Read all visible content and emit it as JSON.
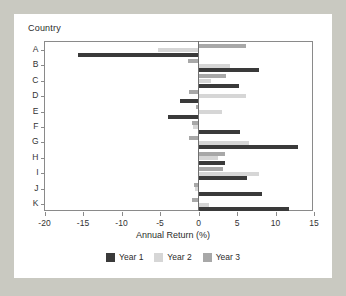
{
  "chart_data": {
    "type": "bar",
    "orientation": "horizontal",
    "title": "",
    "group_label": "Country",
    "xlabel": "Annual Return (%)",
    "ylabel": "Country",
    "categories": [
      "A",
      "B",
      "C",
      "D",
      "E",
      "F",
      "G",
      "H",
      "I",
      "J",
      "K"
    ],
    "xlim": [
      -20,
      15
    ],
    "xticks": [
      -20,
      -15,
      -10,
      -5,
      0,
      5,
      10,
      15
    ],
    "xticklabels": [
      "-20",
      "-15",
      "-10",
      "-5",
      "0",
      "5",
      "10",
      "15"
    ],
    "grid": false,
    "legend_position": "bottom",
    "series": [
      {
        "name": "Year 1",
        "color": "#3a3a3a",
        "values": [
          -15.7,
          7.9,
          5.3,
          -2.4,
          -4.0,
          5.4,
          12.9,
          3.5,
          6.3,
          8.2,
          11.7
        ]
      },
      {
        "name": "Year 2",
        "color": "#d6d6d6",
        "values": [
          -5.3,
          4.1,
          1.6,
          6.2,
          3.0,
          -0.7,
          6.6,
          2.5,
          7.8,
          -0.5,
          1.3
        ]
      },
      {
        "name": "Year 3",
        "color": "#a8a8a8",
        "values": [
          6.2,
          -1.4,
          3.6,
          -1.2,
          -0.3,
          -0.8,
          -1.2,
          3.4,
          3.2,
          -0.6,
          -0.9
        ]
      }
    ]
  },
  "legend": {
    "items": [
      {
        "label": "Year 1",
        "color": "#3a3a3a"
      },
      {
        "label": "Year 2",
        "color": "#d6d6d6"
      },
      {
        "label": "Year 3",
        "color": "#a8a8a8"
      }
    ]
  }
}
